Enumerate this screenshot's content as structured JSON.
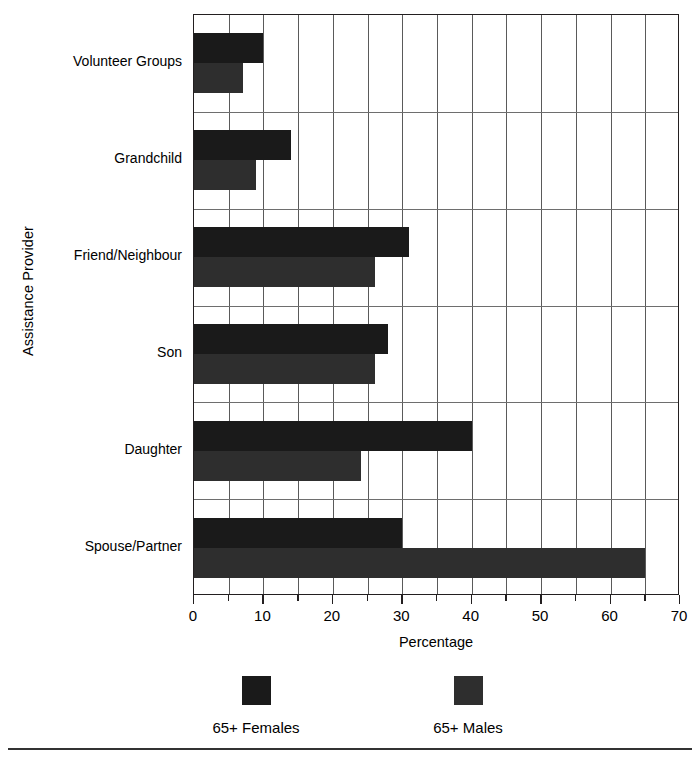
{
  "chart_data": {
    "type": "bar",
    "orientation": "horizontal",
    "title": "",
    "xlabel": "Percentage",
    "ylabel": "Assistance Provider",
    "xlim": [
      0,
      70
    ],
    "xticks": [
      0,
      10,
      20,
      30,
      40,
      50,
      60,
      70
    ],
    "xtick_labels": [
      "0",
      "10",
      "20",
      "30",
      "40",
      "50",
      "60",
      "70"
    ],
    "minor_tick_interval": 5,
    "grid": "vertical gridlines every 5 units, horizontal gridlines between category groups",
    "legend_position": "below plot",
    "categories": [
      "Volunteer Groups",
      "Grandchild",
      "Friend/Neighbour",
      "Son",
      "Daughter",
      "Spouse/Partner"
    ],
    "series": [
      {
        "name": "65+ Females",
        "color": "#1a1a1a",
        "values": [
          10,
          14,
          31,
          28,
          40,
          30
        ]
      },
      {
        "name": "65+ Males",
        "color": "#2e2e2e",
        "values": [
          7,
          9,
          26,
          26,
          24,
          65
        ]
      }
    ]
  },
  "axes": {
    "x_title": "Percentage",
    "y_title": "Assistance Provider"
  },
  "legend": {
    "entries": [
      {
        "label": "65+ Females",
        "color": "#1a1a1a"
      },
      {
        "label": "65+ Males",
        "color": "#2e2e2e"
      }
    ]
  },
  "colors": {
    "females": "#1a1a1a",
    "males": "#2e2e2e",
    "axis": "#231f20",
    "gridline": "#5a5a5a",
    "background": "#ffffff"
  }
}
